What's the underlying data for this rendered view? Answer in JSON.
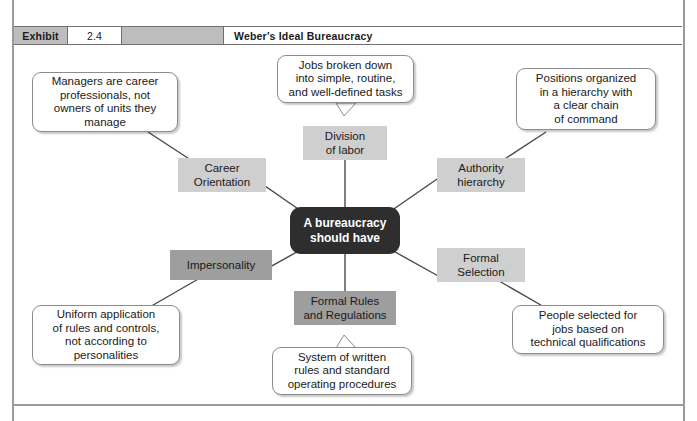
{
  "exhibit": {
    "label": "Exhibit",
    "number": "2.4",
    "title": "Weber's Ideal Bureaucracy"
  },
  "diagram": {
    "center": {
      "text": "A bureaucracy\nshould have",
      "color": "#2e2e2e",
      "text_color": "#ffffff"
    },
    "nodes": [
      {
        "id": "division-of-labor",
        "text": "Division\nof labor",
        "shade": "light",
        "color": "#cfcfcf"
      },
      {
        "id": "authority-hierarchy",
        "text": "Authority\nhierarchy",
        "shade": "light",
        "color": "#cfcfcf"
      },
      {
        "id": "formal-selection",
        "text": "Formal\nSelection",
        "shade": "light",
        "color": "#cfcfcf"
      },
      {
        "id": "formal-rules",
        "text": "Formal Rules\nand Regulations",
        "shade": "medium",
        "color": "#9e9e9e"
      },
      {
        "id": "impersonality",
        "text": "Impersonality",
        "shade": "medium",
        "color": "#9e9e9e"
      },
      {
        "id": "career-orientation",
        "text": "Career\nOrientation",
        "shade": "light",
        "color": "#cfcfcf"
      }
    ],
    "callouts": [
      {
        "id": "callout-division-of-labor",
        "text": "Jobs broken down\ninto simple, routine,\nand well-defined tasks"
      },
      {
        "id": "callout-career-orientation",
        "text": "Managers are career\nprofessionals, not\nowners of units they\nmanage"
      },
      {
        "id": "callout-authority-hierarchy",
        "text": "Positions organized\nin a hierarchy with\na clear chain\nof command"
      },
      {
        "id": "callout-formal-selection",
        "text": "People selected for\njobs based on\ntechnical qualifications"
      },
      {
        "id": "callout-formal-rules",
        "text": "System of written\nrules and standard\noperating procedures"
      },
      {
        "id": "callout-impersonality",
        "text": "Uniform application\nof rules and controls,\nnot according to\npersonalities"
      }
    ]
  }
}
